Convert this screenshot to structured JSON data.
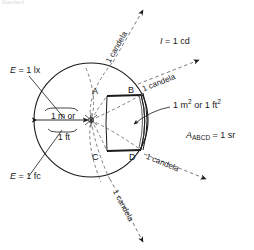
{
  "figure": {
    "header_text": "Standard",
    "colors": {
      "ink": "#1a1a1a",
      "background": "#ffffff",
      "dashed": "#555555",
      "header_faint": "#d8d8d8"
    },
    "labels": {
      "illuminance_lux": "E = 1 lx",
      "illuminance_footcandle": "E = 1 fc",
      "intensity": "I = 1 cd",
      "area": "1 m2 or 1 ft2",
      "solid_angle": "AABCD = 1 sr",
      "distance_metric": "1 m or",
      "distance_imperial": "1 ft"
    },
    "label_parts": {
      "illuminance_lux_symbol": "E",
      "illuminance_lux_value": "= 1 lx",
      "illuminance_fc_symbol": "E",
      "illuminance_fc_value": "= 1 fc",
      "intensity_symbol": "I",
      "intensity_value": "= 1 cd",
      "area_prefix": "1 m",
      "area_exp1": "2",
      "area_mid": " or 1 ft",
      "area_exp2": "2",
      "solid_angle_symbol": "A",
      "solid_angle_sub": "ABCD",
      "solid_angle_value": "= 1 sr"
    },
    "vertices": [
      "A",
      "B",
      "C",
      "D"
    ],
    "rays": [
      {
        "id": "ray-top",
        "label": "1 candela"
      },
      {
        "id": "ray-upper-right",
        "label": "1 candela"
      },
      {
        "id": "ray-lower-right",
        "label": "1 candela"
      },
      {
        "id": "ray-bottom",
        "label": "1 candela"
      }
    ],
    "geometry": {
      "circle_center_x": 91,
      "circle_center_y": 120,
      "circle_radius": 65,
      "source_point_label": "point source"
    }
  }
}
